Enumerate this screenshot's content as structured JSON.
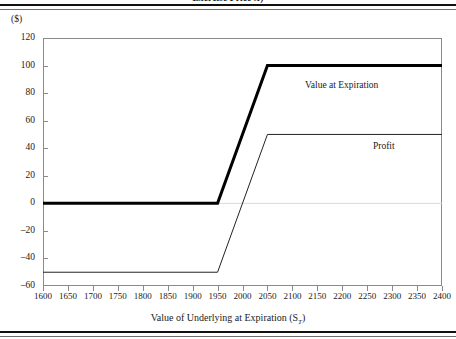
{
  "figure": {
    "caption_prefix": "Exercise Price ",
    "caption_symbol": "X",
    "caption_suffix": ")",
    "units_label": "($)"
  },
  "chart_data": {
    "type": "line",
    "title": "Exercise Price X)",
    "xlabel": "Value of Underlying at Expiration (S_T)",
    "xlabel_text": "Value of Underlying at Expiration (S",
    "xlabel_sub": "T",
    "xlabel_close": ")",
    "ylabel": "($)",
    "xlim": [
      1600,
      2400
    ],
    "ylim": [
      -60,
      120
    ],
    "grid": false,
    "legend_position": "inline-annotations",
    "x_ticks": [
      1600,
      1650,
      1700,
      1750,
      1800,
      1850,
      1900,
      1950,
      2000,
      2050,
      2100,
      2150,
      2200,
      2250,
      2300,
      2350,
      2400
    ],
    "y_ticks": [
      120,
      100,
      80,
      60,
      40,
      20,
      0,
      -20,
      -40,
      -60
    ],
    "y_tick_labels": [
      "120",
      "100",
      "80",
      "60",
      "40",
      "20",
      "0",
      "–20",
      "–40",
      "–60"
    ],
    "strike_price": 1950,
    "premium": 50,
    "breakeven": 2000,
    "zero_line": 0,
    "series": [
      {
        "name": "Value at Expiration",
        "annotation": "Value at Expiration",
        "style": "thick",
        "color": "#000000",
        "line_width": 3,
        "x": [
          1600,
          1950,
          2050,
          2400
        ],
        "values": [
          0,
          0,
          100,
          100
        ]
      },
      {
        "name": "Profit",
        "annotation": "Profit",
        "style": "thin",
        "color": "#222222",
        "line_width": 1,
        "x": [
          1600,
          1950,
          2050,
          2400
        ],
        "values": [
          -50,
          -50,
          50,
          50
        ]
      }
    ]
  }
}
